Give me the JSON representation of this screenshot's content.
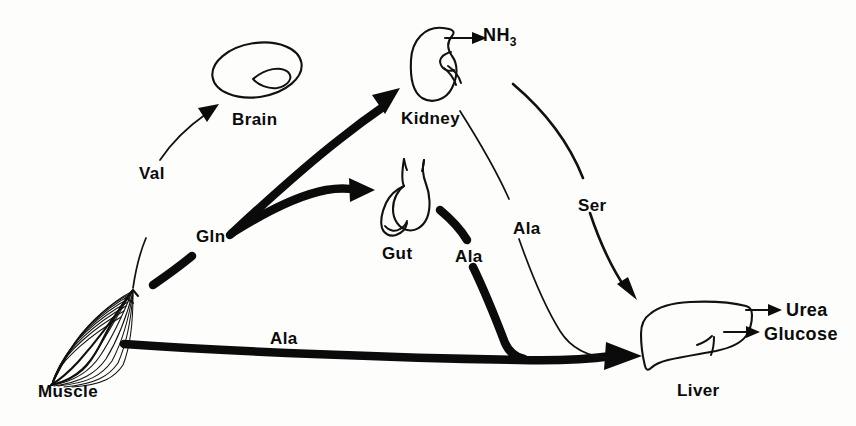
{
  "figure": {
    "type": "biochemical-pathway-diagram",
    "background_color": "#fdfdfb",
    "ink_color": "#0b0b0b"
  },
  "organs": [
    {
      "id": "muscle",
      "label": "Muscle",
      "icon": "skeletal-muscle-icon",
      "x": 38,
      "y": 383
    },
    {
      "id": "brain",
      "label": "Brain",
      "icon": "brain-icon",
      "x": 232,
      "y": 111
    },
    {
      "id": "kidney",
      "label": "Kidney",
      "icon": "kidney-icon",
      "x": 401,
      "y": 110
    },
    {
      "id": "gut",
      "label": "Gut",
      "icon": "stomach-gut-icon",
      "x": 382,
      "y": 245
    },
    {
      "id": "liver",
      "label": "Liver",
      "icon": "liver-icon",
      "x": 677,
      "y": 382
    }
  ],
  "metabolites": [
    {
      "id": "val-label",
      "label": "Val",
      "from": "muscle",
      "to": "brain",
      "weight": "thin",
      "x": 139,
      "y": 165
    },
    {
      "id": "gln-label",
      "label": "Gln",
      "from": "muscle",
      "to": "kidney",
      "weight": "thick",
      "x": 196,
      "y": 228
    },
    {
      "id": "ala-gut-label",
      "label": "Ala",
      "from": "gut",
      "to": "liver",
      "weight": "thick",
      "x": 455,
      "y": 248
    },
    {
      "id": "ala-kidney-label",
      "label": "Ala",
      "from": "kidney",
      "to": "liver",
      "weight": "thin",
      "x": 513,
      "y": 220
    },
    {
      "id": "ser-label",
      "label": "Ser",
      "from": "kidney",
      "to": "liver",
      "weight": "medium",
      "x": 578,
      "y": 197
    },
    {
      "id": "ala-muscle-label",
      "label": "Ala",
      "from": "muscle",
      "to": "liver",
      "weight": "thick",
      "x": 270,
      "y": 330
    }
  ],
  "products": [
    {
      "id": "nh3",
      "label": "NH",
      "subscript": "3",
      "from": "kidney",
      "x": 483,
      "y": 26
    },
    {
      "id": "urea",
      "label": "Urea",
      "from": "liver",
      "x": 786,
      "y": 301
    },
    {
      "id": "glucose",
      "label": "Glucose",
      "from": "liver",
      "x": 764,
      "y": 325
    }
  ]
}
